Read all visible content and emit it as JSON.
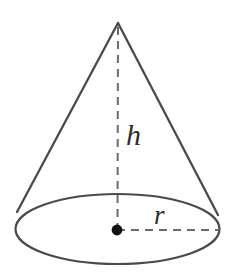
{
  "figure": {
    "name": "cone-with-height-and-radius",
    "background_color": "#ffffff",
    "stroke_color": "#4a4a4a",
    "dash_color": "#6b6b6b",
    "dot_color": "#111111",
    "label_color": "#2e2e2e"
  },
  "labels": {
    "height": "h",
    "radius": "r"
  },
  "geometry": {
    "apex": {
      "x": 118,
      "y": 23
    },
    "base_center": {
      "x": 117.5,
      "y": 229
    },
    "base_rx": 102,
    "base_ry": 35,
    "left_tangent": {
      "x": 17,
      "y": 212
    },
    "right_tangent": {
      "x": 218,
      "y": 215
    },
    "center_dot": {
      "x": 117,
      "y": 230,
      "r": 5
    },
    "height_line": {
      "x1": 118,
      "y1": 27,
      "x2": 117.5,
      "y2": 229
    },
    "radius_line": {
      "x1": 117,
      "y1": 230,
      "x2": 219,
      "y2": 230
    },
    "stroke_width": 2.2,
    "dash_width": 2.0,
    "dash_pattern": "8 6"
  },
  "icons": {
    "cone": "cone-icon",
    "center_point": "center-point-icon"
  }
}
